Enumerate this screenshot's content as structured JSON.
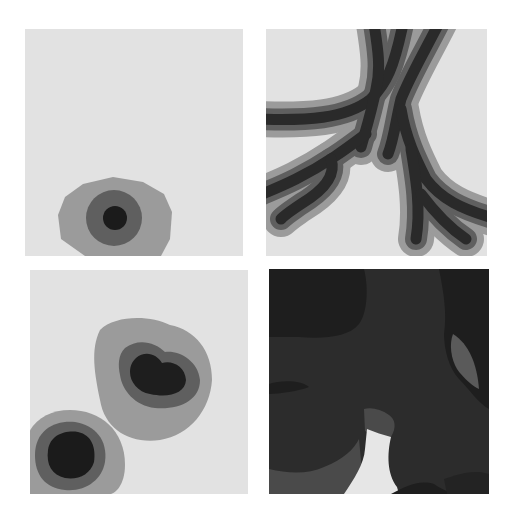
{
  "figure": {
    "layout": "2x2 grid of grayscale distance-field panels",
    "colors": {
      "page_background": "#ffffff",
      "panel_background": "#e2e2e2",
      "outer_band": "#9b9b9b",
      "middle_band": "#5f5f5f",
      "inner_core": "#262626",
      "deep_core": "#1b1b1b",
      "br_darkest": "#1e1e1e",
      "br_dark": "#2c2c2c",
      "br_mid": "#4a4a4a",
      "br_light_gap": "#e6e6e6"
    },
    "panels": [
      {
        "id": "top-left",
        "label": "Single concentric blob near bottom-left",
        "rings": 3
      },
      {
        "id": "top-right",
        "label": "Branching vessel-like structure with concentric bands",
        "rings": 3
      },
      {
        "id": "bottom-left",
        "label": "Two concentric blobs (kidney-shaped and round)",
        "rings": 3
      },
      {
        "id": "bottom-right",
        "label": "Mostly dark overlapping regions with a light gap",
        "rings": 4
      }
    ]
  }
}
